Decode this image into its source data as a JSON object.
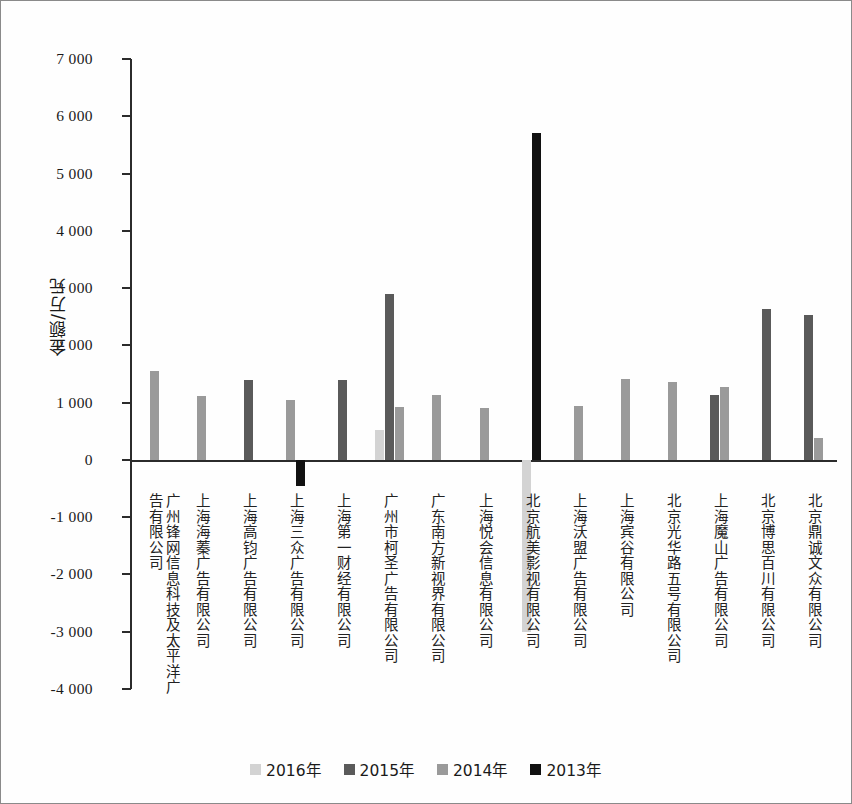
{
  "chart_data": {
    "type": "bar",
    "title": "",
    "xlabel": "",
    "ylabel": "金额/万元",
    "ylim": [
      -4000,
      7000
    ],
    "ytick_labels": [
      "7 000",
      "6 000",
      "5 000",
      "4 000",
      "3 000",
      "2 000",
      "1 000",
      "0",
      "-1 000",
      "-2 000",
      "-3 000",
      "-4 000"
    ],
    "ytick_values": [
      7000,
      6000,
      5000,
      4000,
      3000,
      2000,
      1000,
      0,
      -1000,
      -2000,
      -3000,
      -4000
    ],
    "grid": false,
    "legend_position": "bottom",
    "categories": [
      "广州锋网信息科技及太平洋广\n告有限公司",
      "上海海蓁广告有限公司",
      "上海高钧广告有限公司",
      "上海三众广告有限公司",
      "上海第一财经有限公司",
      "广州市柯圣广告有限公司",
      "广东南方新视界有限公司",
      "上海悦会信息有限公司",
      "北京航美影视有限公司",
      "上海沃盟广告有限公司",
      "上海宾谷有限公司",
      "北京光华路五号有限公司",
      "上海魔山广告有限公司",
      "北京博思百川有限公司",
      "北京鼎诚文众有限公司"
    ],
    "series": [
      {
        "name": "2016年",
        "color": "#d3d3d3",
        "values": [
          null,
          null,
          null,
          null,
          null,
          520,
          null,
          null,
          -3000,
          null,
          null,
          null,
          null,
          null,
          null
        ]
      },
      {
        "name": "2015年",
        "color": "#5a5a5a",
        "values": [
          null,
          null,
          1400,
          null,
          1390,
          2890,
          null,
          null,
          null,
          null,
          null,
          null,
          1140,
          2630,
          2530
        ]
      },
      {
        "name": "2014年",
        "color": "#9a9a9a",
        "values": [
          1555,
          1120,
          null,
          1040,
          null,
          920,
          1130,
          905,
          null,
          950,
          1420,
          1360,
          1270,
          null,
          390
        ]
      },
      {
        "name": "2013年",
        "color": "#111111",
        "values": [
          null,
          null,
          null,
          -450,
          null,
          null,
          null,
          null,
          5700,
          null,
          null,
          null,
          null,
          null,
          null
        ]
      }
    ]
  },
  "legend": {
    "items": [
      {
        "label": "2016年",
        "color": "#d3d3d3"
      },
      {
        "label": "2015年",
        "color": "#5a5a5a"
      },
      {
        "label": "2014年",
        "color": "#9a9a9a"
      },
      {
        "label": "2013年",
        "color": "#111111"
      }
    ]
  }
}
